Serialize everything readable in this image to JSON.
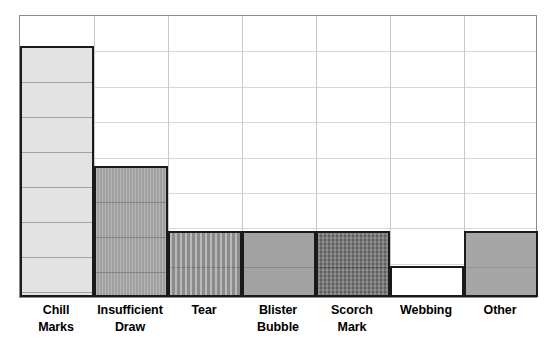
{
  "chart_data": {
    "type": "bar",
    "title": "",
    "subtitle": "",
    "xlabel": "",
    "ylabel": "",
    "categories": [
      "Chill Marks",
      "Insufficient Draw",
      "Tear",
      "Blister Bubble",
      "Scorch Mark",
      "Webbing",
      "Other"
    ],
    "category_lines": [
      [
        "Chill",
        "Marks"
      ],
      [
        "Insufficient",
        "Draw"
      ],
      [
        "Tear",
        ""
      ],
      [
        "Blister",
        "Bubble"
      ],
      [
        "Scorch",
        "Mark"
      ],
      [
        "Webbing",
        ""
      ],
      [
        "Other",
        ""
      ]
    ],
    "values": [
      7.1,
      3.7,
      1.85,
      1.85,
      1.85,
      0.85,
      1.85
    ],
    "ylim": [
      0,
      8
    ],
    "y_gridline_count": 8,
    "grid": true,
    "legend": false,
    "legend_position": "none",
    "tick_labels_x": [
      "Chill Marks",
      "Insufficient Draw",
      "Tear",
      "Blister Bubble",
      "Scorch Mark",
      "Webbing",
      "Other"
    ],
    "tick_labels_y": [],
    "annotations": []
  },
  "bars": [
    {
      "name": "chill-marks",
      "label_line1": "Chill",
      "label_line2": "Marks",
      "value": 7.1,
      "height_px": 251,
      "fill": "#e3e3e3",
      "border": "#1a1a1a",
      "texture": "horizontal-bands"
    },
    {
      "name": "insufficient-draw",
      "label_line1": "Insufficient",
      "label_line2": "Draw",
      "value": 3.7,
      "height_px": 131,
      "fill": "#a8a8a8",
      "border": "#1a1a1a",
      "texture": "fine-vertical-stripes"
    },
    {
      "name": "tear",
      "label_line1": "Tear",
      "label_line2": "",
      "value": 1.85,
      "height_px": 66,
      "fill": "#9b9b9b",
      "border": "#1a1a1a",
      "texture": "vertical-stripes"
    },
    {
      "name": "blister-bubble",
      "label_line1": "Blister",
      "label_line2": "Bubble",
      "value": 1.85,
      "height_px": 66,
      "fill": "#a2a2a2",
      "border": "#1a1a1a",
      "texture": "solid"
    },
    {
      "name": "scorch-mark",
      "label_line1": "Scorch",
      "label_line2": "Mark",
      "value": 1.85,
      "height_px": 66,
      "fill": "#7a7a7a",
      "border": "#1a1a1a",
      "texture": "cross-hatch"
    },
    {
      "name": "webbing",
      "label_line1": "Webbing",
      "label_line2": "",
      "value": 0.85,
      "height_px": 31,
      "fill": "#ffffff",
      "border": "#1a1a1a",
      "texture": "none"
    },
    {
      "name": "other",
      "label_line1": "Other",
      "label_line2": "",
      "value": 1.85,
      "height_px": 66,
      "fill": "#a6a6a6",
      "border": "#1a1a1a",
      "texture": "solid"
    }
  ],
  "plot": {
    "border_color": "#8d8d8d",
    "gridline_color": "#d8d8d8",
    "background": "#ffffff",
    "rows": 8,
    "columns": 7
  }
}
